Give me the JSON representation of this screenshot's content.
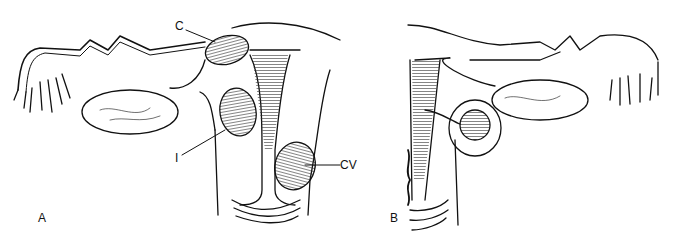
{
  "figure": {
    "panels": [
      {
        "id": "A",
        "label": "A"
      },
      {
        "id": "B",
        "label": "B"
      }
    ],
    "annotations": [
      {
        "id": "C",
        "label": "C"
      },
      {
        "id": "I",
        "label": "I"
      },
      {
        "id": "CV",
        "label": "CV"
      }
    ],
    "colors": {
      "ink": "#111111",
      "background": "#ffffff"
    }
  }
}
